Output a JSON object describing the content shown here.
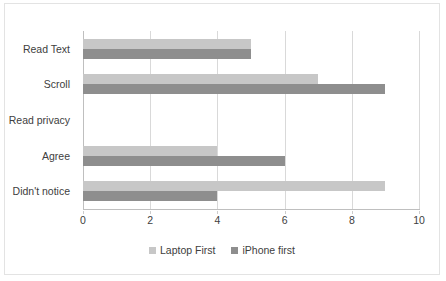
{
  "chart_data": {
    "type": "bar",
    "orientation": "horizontal",
    "title": "",
    "xlabel": "",
    "ylabel": "",
    "categories": [
      "Read Text",
      "Scroll",
      "Read privacy",
      "Agree",
      "Didn't notice"
    ],
    "series": [
      {
        "name": "Laptop First",
        "color": "#c7c7c7",
        "values": [
          5,
          7,
          0,
          4,
          9
        ]
      },
      {
        "name": "iPhone first",
        "color": "#8e8e8e",
        "values": [
          5,
          9,
          0,
          6,
          4
        ]
      }
    ],
    "xlim": [
      0,
      10
    ],
    "xticks": [
      0,
      2,
      4,
      6,
      8,
      10
    ],
    "xtick_labels": [
      "0",
      "2",
      "4",
      "6",
      "8",
      "10"
    ],
    "grid": "vertical",
    "legend_position": "bottom",
    "plot_border_color": "#e3e3e3",
    "gridline_color": "#d9d9d9",
    "axis_color": "#bfbfbf"
  }
}
